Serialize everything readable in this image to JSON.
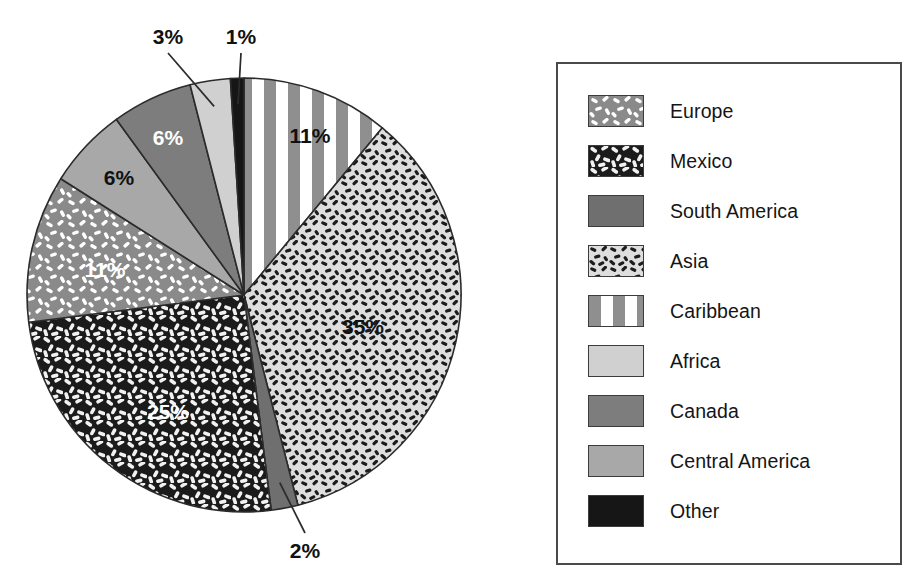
{
  "chart_data": {
    "type": "pie",
    "title": "",
    "subtitle": "",
    "xlabel": "",
    "ylabel": "",
    "legend_position": "right",
    "grid": false,
    "unit": "%",
    "categories": [
      "Europe",
      "Mexico",
      "South America",
      "Asia",
      "Caribbean",
      "Africa",
      "Canada",
      "Central America",
      "Other"
    ],
    "values": [
      11,
      25,
      2,
      35,
      11,
      3,
      6,
      6,
      1
    ],
    "slices": [
      {
        "label": "Caribbean",
        "value": 11,
        "value_text": "11%",
        "fill": "stripes-vertical",
        "base_color": "#8f8f8f",
        "label_color": "#111111",
        "label_x": 310,
        "label_y": 136,
        "leader": false
      },
      {
        "label": "Asia",
        "value": 35,
        "value_text": "35%",
        "fill": "dots-dark-on-light",
        "base_color": "#dedede",
        "label_color": "#111111",
        "label_x": 363,
        "label_y": 327,
        "leader": false
      },
      {
        "label": "South America",
        "value": 2,
        "value_text": "2%",
        "fill": "solid",
        "base_color": "#6f6f6f",
        "label_color": "#111111",
        "label_x": 305,
        "label_y": 551,
        "leader": true
      },
      {
        "label": "Mexico",
        "value": 25,
        "value_text": "25%",
        "fill": "dashes-white-on-black",
        "base_color": "#1b1b1b",
        "label_color": "#ffffff",
        "label_x": 168,
        "label_y": 412,
        "leader": false
      },
      {
        "label": "Europe",
        "value": 11,
        "value_text": "11%",
        "fill": "dashes-white-on-gray",
        "base_color": "#8a8a8a",
        "label_color": "#ffffff",
        "label_x": 105,
        "label_y": 270,
        "leader": false
      },
      {
        "label": "Central America",
        "value": 6,
        "value_text": "6%",
        "fill": "solid",
        "base_color": "#a8a8a8",
        "label_color": "#111111",
        "label_x": 119,
        "label_y": 178,
        "leader": false
      },
      {
        "label": "Canada",
        "value": 6,
        "value_text": "6%",
        "fill": "solid",
        "base_color": "#7d7d7d",
        "label_color": "#ffffff",
        "label_x": 168,
        "label_y": 138,
        "leader": false
      },
      {
        "label": "Africa",
        "value": 3,
        "value_text": "3%",
        "fill": "solid",
        "base_color": "#d0d0d0",
        "label_color": "#111111",
        "label_x": 168,
        "label_y": 37,
        "leader": true
      },
      {
        "label": "Other",
        "value": 1,
        "value_text": "1%",
        "fill": "solid",
        "base_color": "#161616",
        "label_color": "#111111",
        "label_x": 241,
        "label_y": 37,
        "leader": true
      }
    ],
    "callout_labels": [
      "3%",
      "1%",
      "2%"
    ],
    "geometry": {
      "center_x": 244,
      "center_y": 295,
      "radius": 217,
      "start_angle_deg": 90,
      "direction": "clockwise"
    }
  },
  "legend": {
    "items": [
      {
        "label": "Europe",
        "fill": "dashes-white-on-gray",
        "base_color": "#8a8a8a"
      },
      {
        "label": "Mexico",
        "fill": "dashes-white-on-black",
        "base_color": "#1b1b1b"
      },
      {
        "label": "South America",
        "fill": "solid",
        "base_color": "#6f6f6f"
      },
      {
        "label": "Asia",
        "fill": "dots-dark-on-light",
        "base_color": "#dedede"
      },
      {
        "label": "Caribbean",
        "fill": "stripes-vertical",
        "base_color": "#8f8f8f"
      },
      {
        "label": "Africa",
        "fill": "solid",
        "base_color": "#d0d0d0"
      },
      {
        "label": "Canada",
        "fill": "solid",
        "base_color": "#7d7d7d"
      },
      {
        "label": "Central America",
        "fill": "solid",
        "base_color": "#a8a8a8"
      },
      {
        "label": "Other",
        "fill": "solid",
        "base_color": "#161616"
      }
    ]
  },
  "colors": {
    "outline": "#2b2b2b",
    "legend_border": "#4a4a4a",
    "background": "#ffffff",
    "label_dark": "#111111",
    "label_light": "#ffffff"
  }
}
